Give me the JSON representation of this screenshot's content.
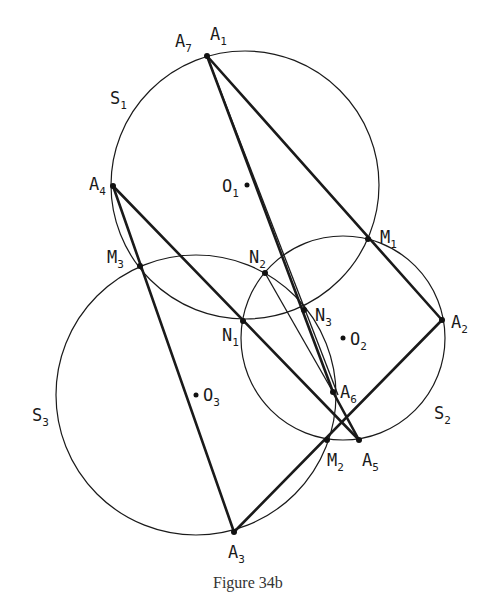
{
  "figure": {
    "caption": "Figure 34b",
    "colors": {
      "ink": "#1a1a1a",
      "background": "#ffffff"
    },
    "circles": [
      {
        "name": "S",
        "sub": "1",
        "center_label": "O",
        "center_sub": "1",
        "cx": 245,
        "cy": 185,
        "r": 134
      },
      {
        "name": "S",
        "sub": "2",
        "center_label": "O",
        "center_sub": "2",
        "cx": 343,
        "cy": 338,
        "r": 102
      },
      {
        "name": "S",
        "sub": "3",
        "center_label": "O",
        "center_sub": "3",
        "cx": 196,
        "cy": 395,
        "r": 140
      }
    ],
    "points": {
      "A1": {
        "x": 207,
        "y": 56
      },
      "A2": {
        "x": 442,
        "y": 320
      },
      "A3": {
        "x": 234,
        "y": 532
      },
      "A4": {
        "x": 113,
        "y": 186
      },
      "A5": {
        "x": 359,
        "y": 440
      },
      "A6": {
        "x": 333,
        "y": 392
      },
      "M1": {
        "x": 368,
        "y": 239
      },
      "M2": {
        "x": 327,
        "y": 440
      },
      "M3": {
        "x": 140,
        "y": 266
      },
      "N1": {
        "x": 243,
        "y": 321
      },
      "N2": {
        "x": 265,
        "y": 273
      },
      "N3": {
        "x": 304,
        "y": 310
      }
    },
    "labels": {
      "A7": {
        "main": "A",
        "sub": "7"
      },
      "A1": {
        "main": "A",
        "sub": "1"
      },
      "A2": {
        "main": "A",
        "sub": "2"
      },
      "A3": {
        "main": "A",
        "sub": "3"
      },
      "A4": {
        "main": "A",
        "sub": "4"
      },
      "A5": {
        "main": "A",
        "sub": "5"
      },
      "A6": {
        "main": "A",
        "sub": "6"
      },
      "M1": {
        "main": "M",
        "sub": "1"
      },
      "M2": {
        "main": "M",
        "sub": "2"
      },
      "M3": {
        "main": "M",
        "sub": "3"
      },
      "N1": {
        "main": "N",
        "sub": "1"
      },
      "N2": {
        "main": "N",
        "sub": "2"
      },
      "N3": {
        "main": "N",
        "sub": "3"
      },
      "O1": {
        "main": "O",
        "sub": "1"
      },
      "O2": {
        "main": "O",
        "sub": "2"
      },
      "O3": {
        "main": "O",
        "sub": "3"
      },
      "S1": {
        "main": "S",
        "sub": "1"
      },
      "S2": {
        "main": "S",
        "sub": "2"
      },
      "S3": {
        "main": "S",
        "sub": "3"
      }
    }
  }
}
